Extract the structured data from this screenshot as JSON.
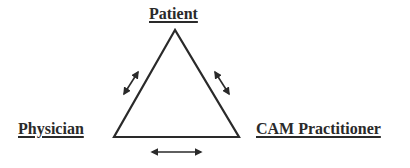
{
  "diagram": {
    "type": "triangle-relationship",
    "nodes": {
      "top": {
        "label": "Patient"
      },
      "left": {
        "label": "Physician"
      },
      "right": {
        "label": "CAM Practitioner"
      }
    },
    "edges": [
      {
        "from": "Patient",
        "to": "Physician",
        "direction": "bidirectional"
      },
      {
        "from": "Patient",
        "to": "CAM Practitioner",
        "direction": "bidirectional"
      },
      {
        "from": "Physician",
        "to": "CAM Practitioner",
        "direction": "bidirectional"
      }
    ],
    "colors": {
      "line": "#2a2a2a",
      "background": "#ffffff"
    }
  }
}
